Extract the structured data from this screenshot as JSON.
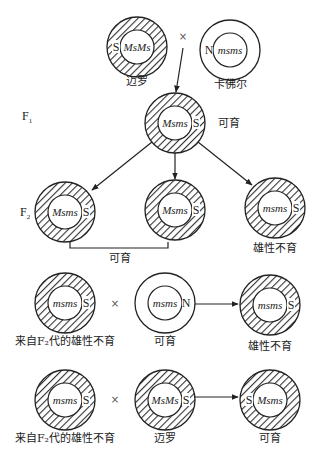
{
  "colors": {
    "stroke": "#222222",
    "hatch": "#333333",
    "text": "#222222",
    "background": "#ffffff"
  },
  "generations": {
    "f1": "F",
    "f1_sub": "1",
    "f2": "F",
    "f2_sub": "2"
  },
  "cross_symbol": "×",
  "cells": [
    {
      "id": "p1-maro",
      "cx": 137,
      "cy": 47,
      "sterile_cytoplasm": true,
      "cytoplasm": "S",
      "cyto_side": "left",
      "genotype": "MsMs",
      "label": "迈罗",
      "label_y": 85
    },
    {
      "id": "p2-kafir",
      "cx": 230,
      "cy": 50,
      "sterile_cytoplasm": false,
      "cytoplasm": "N",
      "cyto_side": "left",
      "genotype": "msms",
      "label": "卡佛尔",
      "label_y": 88
    },
    {
      "id": "f1",
      "cx": 175,
      "cy": 123,
      "sterile_cytoplasm": true,
      "cytoplasm": "S",
      "cyto_side": "right",
      "genotype": "Msms",
      "label": "可育",
      "label_x": 218,
      "label_y": 127,
      "label_anchor": "start"
    },
    {
      "id": "f2-a",
      "cx": 65,
      "cy": 212,
      "sterile_cytoplasm": true,
      "cytoplasm": "S",
      "cyto_side": "right",
      "genotype": "Msms",
      "label": "",
      "label_y": 0
    },
    {
      "id": "f2-b",
      "cx": 175,
      "cy": 210,
      "sterile_cytoplasm": true,
      "cytoplasm": "S",
      "cyto_side": "right",
      "genotype": "Msms",
      "label": "",
      "label_y": 0
    },
    {
      "id": "f2-c",
      "cx": 275,
      "cy": 208,
      "sterile_cytoplasm": true,
      "cytoplasm": "S",
      "cyto_side": "right",
      "genotype": "msms",
      "label": "雄性不育",
      "label_y": 252
    },
    {
      "id": "r3-a",
      "cx": 65,
      "cy": 303,
      "sterile_cytoplasm": true,
      "cytoplasm": "S",
      "cyto_side": "right",
      "genotype": "msms",
      "label": "来自F₂代的雄性不育",
      "label_y": 345
    },
    {
      "id": "r3-b",
      "cx": 165,
      "cy": 303,
      "sterile_cytoplasm": false,
      "cytoplasm": "N",
      "cyto_side": "right",
      "genotype": "msms",
      "label": "可育",
      "label_y": 345
    },
    {
      "id": "r3-c",
      "cx": 270,
      "cy": 305,
      "sterile_cytoplasm": true,
      "cytoplasm": "S",
      "cyto_side": "right",
      "genotype": "msms",
      "label": "雄性不育",
      "label_y": 350
    },
    {
      "id": "r4-a",
      "cx": 65,
      "cy": 400,
      "sterile_cytoplasm": true,
      "cytoplasm": "S",
      "cyto_side": "right",
      "genotype": "msms",
      "label": "来自F₂代的雄性不育",
      "label_y": 442
    },
    {
      "id": "r4-b",
      "cx": 165,
      "cy": 400,
      "sterile_cytoplasm": true,
      "cytoplasm": "S",
      "cyto_side": "right",
      "genotype": "MsMs",
      "label": "迈罗",
      "label_y": 442
    },
    {
      "id": "r4-c",
      "cx": 270,
      "cy": 400,
      "sterile_cytoplasm": true,
      "cytoplasm": "S",
      "cyto_side": "left",
      "genotype": "Msms",
      "label": "可育",
      "label_y": 442
    }
  ],
  "crosses": [
    {
      "x": 183,
      "y": 40
    },
    {
      "x": 115,
      "y": 307
    },
    {
      "x": 115,
      "y": 403
    }
  ],
  "f2_bracket_label": "可育"
}
